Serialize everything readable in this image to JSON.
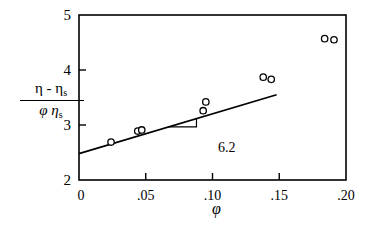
{
  "chart_data": {
    "type": "scatter",
    "title": "",
    "xlabel": "φ",
    "ylabel": "(η - η_s) / (φ η_s)",
    "xlim": [
      0,
      0.2
    ],
    "ylim": [
      2,
      5
    ],
    "x_ticks": [
      "0",
      ".05",
      ".10",
      ".15",
      ".20"
    ],
    "x_tick_values": [
      0,
      0.05,
      0.1,
      0.15,
      0.2
    ],
    "y_ticks": [
      "2",
      "3",
      "4",
      "5"
    ],
    "y_tick_values": [
      2,
      3,
      4,
      5
    ],
    "grid": false,
    "legend": null,
    "series": [
      {
        "name": "measured",
        "marker": "open-circle",
        "points": [
          {
            "x": 0.024,
            "y": 2.69
          },
          {
            "x": 0.044,
            "y": 2.89
          },
          {
            "x": 0.047,
            "y": 2.91
          },
          {
            "x": 0.093,
            "y": 3.26
          },
          {
            "x": 0.095,
            "y": 3.42
          },
          {
            "x": 0.138,
            "y": 3.87
          },
          {
            "x": 0.144,
            "y": 3.83
          },
          {
            "x": 0.184,
            "y": 4.57
          },
          {
            "x": 0.191,
            "y": 4.55
          }
        ]
      },
      {
        "name": "linear fit",
        "type": "line",
        "points": [
          {
            "x": 0.0,
            "y": 2.48
          },
          {
            "x": 0.148,
            "y": 3.55
          }
        ]
      }
    ],
    "annotations": [
      {
        "text": "6.2",
        "type": "slope-triangle",
        "x": 0.072,
        "y": 3.0
      }
    ]
  },
  "labels": {
    "ylabel_num": "η - η",
    "ylabel_num_sub": "s",
    "ylabel_den": "φ η",
    "ylabel_den_sub": "s",
    "xlabel": "φ",
    "slope": "6.2"
  }
}
